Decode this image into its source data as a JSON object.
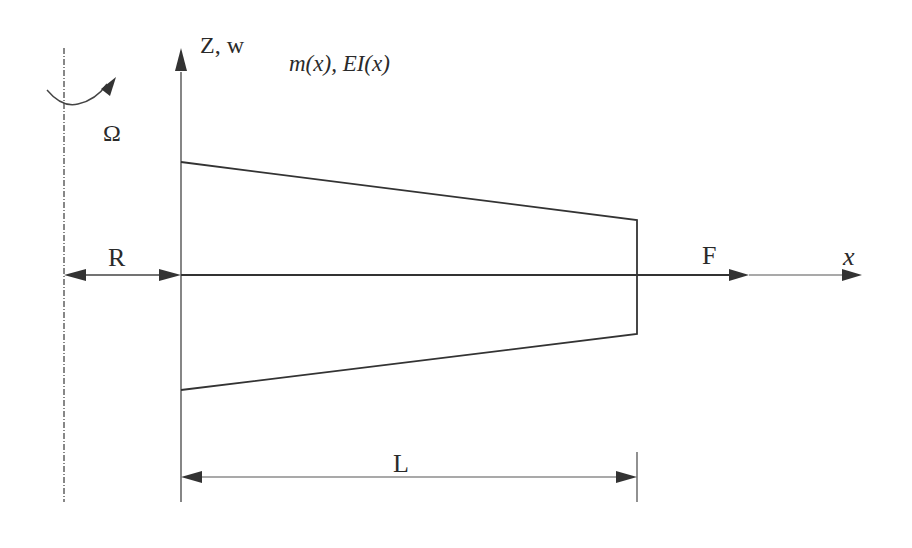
{
  "figure": {
    "colors": {
      "background": "#ffffff",
      "stroke": "#3a3a3a",
      "text": "#2a2a2a"
    }
  },
  "labels": {
    "vertical_axis": "Z, w",
    "properties": "m(x), EI(x)",
    "rotation_speed": "Ω",
    "hub_radius": "R",
    "axial_force": "F",
    "horizontal_axis": "x",
    "beam_length": "L"
  },
  "geometry": {
    "rotation_axis": {
      "x": 64,
      "y1": 48,
      "y2": 502,
      "style": "dash-dot"
    },
    "z_axis": {
      "x": 181,
      "y_tip": 48,
      "y_bottom": 502
    },
    "x_axis": {
      "y": 275,
      "x_start": 181,
      "x_tip": 862
    },
    "force_arrow_tip": {
      "x": 749,
      "y": 275
    },
    "beam_outline": [
      [
        181,
        162
      ],
      [
        637,
        220
      ],
      [
        637,
        334
      ],
      [
        181,
        390
      ]
    ],
    "r_dimension": {
      "y": 275,
      "x1": 64,
      "x2": 181
    },
    "l_dimension": {
      "y": 477,
      "x1": 181,
      "x2": 637
    },
    "l_tick": {
      "x": 637,
      "y1": 452,
      "y2": 502
    },
    "rotation_arc": {
      "cx": 64,
      "description": "curved arrow around rotation axis"
    }
  }
}
